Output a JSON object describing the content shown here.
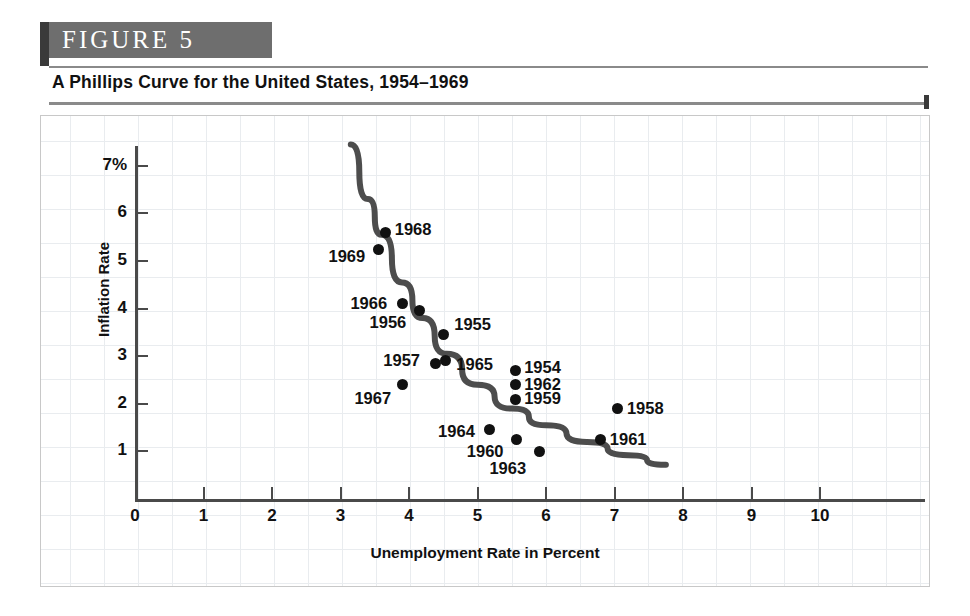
{
  "figure": {
    "badge_label": "FIGURE  5",
    "title": "A Phillips Curve for the United States, 1954–1969"
  },
  "chart_data": {
    "type": "scatter",
    "title": "A Phillips Curve for the United States, 1954–1969",
    "xlabel": "Unemployment Rate in Percent",
    "ylabel": "Inflation Rate",
    "xlim": [
      0,
      11.5
    ],
    "ylim": [
      0,
      7.6
    ],
    "grid": true,
    "legend": "none",
    "xticks": [
      "0",
      "1",
      "2",
      "3",
      "4",
      "5",
      "6",
      "7",
      "8",
      "9",
      "10"
    ],
    "xtick_values": [
      0,
      1,
      2,
      3,
      4,
      5,
      6,
      7,
      8,
      9,
      10
    ],
    "yticks": [
      "1",
      "2",
      "3",
      "4",
      "5",
      "6",
      "7%"
    ],
    "ytick_values": [
      1,
      2,
      3,
      4,
      5,
      6,
      7
    ],
    "points": [
      {
        "label": "1968",
        "x": 3.66,
        "y": 5.6,
        "label_side": "right"
      },
      {
        "label": "1969",
        "x": 3.55,
        "y": 5.25,
        "label_side": "left"
      },
      {
        "label": "1966",
        "x": 3.9,
        "y": 4.1,
        "label_side": "left"
      },
      {
        "label": "1956",
        "x": 4.15,
        "y": 3.95,
        "label_side": "left"
      },
      {
        "label": "1955",
        "x": 4.5,
        "y": 3.45,
        "label_side": "right"
      },
      {
        "label": "1965",
        "x": 4.53,
        "y": 2.9,
        "label_side": "right"
      },
      {
        "label": "1957",
        "x": 4.38,
        "y": 2.85,
        "label_side": "left"
      },
      {
        "label": "1967",
        "x": 3.9,
        "y": 2.4,
        "label_side": "left"
      },
      {
        "label": "1954",
        "x": 5.55,
        "y": 2.7,
        "label_side": "right"
      },
      {
        "label": "1962",
        "x": 5.55,
        "y": 2.4,
        "label_side": "right"
      },
      {
        "label": "1959",
        "x": 5.55,
        "y": 2.1,
        "label_side": "right"
      },
      {
        "label": "1964",
        "x": 5.18,
        "y": 1.45,
        "label_side": "left"
      },
      {
        "label": "1960",
        "x": 5.57,
        "y": 1.25,
        "label_side": "left"
      },
      {
        "label": "1963",
        "x": 5.9,
        "y": 1.0,
        "label_side": "left"
      },
      {
        "label": "1958",
        "x": 7.05,
        "y": 1.9,
        "label_side": "right"
      },
      {
        "label": "1961",
        "x": 6.8,
        "y": 1.25,
        "label_side": "right"
      }
    ],
    "fitted_curve": {
      "name": "Phillips curve",
      "color": "#4d4d4d",
      "x_start": 3.15,
      "x_end": 7.75,
      "points": [
        {
          "x": 3.15,
          "y": 7.45
        },
        {
          "x": 3.4,
          "y": 6.3
        },
        {
          "x": 3.6,
          "y": 5.55
        },
        {
          "x": 3.9,
          "y": 4.55
        },
        {
          "x": 4.2,
          "y": 3.8
        },
        {
          "x": 4.55,
          "y": 3.05
        },
        {
          "x": 5.0,
          "y": 2.4
        },
        {
          "x": 5.5,
          "y": 1.9
        },
        {
          "x": 6.0,
          "y": 1.55
        },
        {
          "x": 6.6,
          "y": 1.2
        },
        {
          "x": 7.2,
          "y": 0.92
        },
        {
          "x": 7.75,
          "y": 0.72
        }
      ]
    }
  }
}
